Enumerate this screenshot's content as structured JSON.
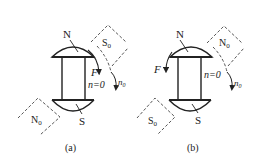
{
  "figures": [
    {
      "id": "a",
      "caption": "(a)",
      "magnet_pole_top": "N",
      "magnet_pole_bottom": "S",
      "force_label": "F",
      "speed_label": "n=0",
      "rotating_pole_top": "S",
      "rotating_pole_top_sub": "0",
      "rotating_pole_bottom": "N",
      "rotating_pole_bottom_sub": "0",
      "rotation_label": "n",
      "rotation_label_sub": "0"
    },
    {
      "id": "b",
      "caption": "(b)",
      "magnet_pole_top": "N",
      "magnet_pole_bottom": "S",
      "force_label": "F",
      "speed_label": "n=0",
      "rotating_pole_top": "N",
      "rotating_pole_top_sub": "0",
      "rotating_pole_bottom": "S",
      "rotating_pole_bottom_sub": "0",
      "rotation_label": "n",
      "rotation_label_sub": "0"
    }
  ],
  "colors": {
    "line": "#222222",
    "background": "#ffffff"
  }
}
